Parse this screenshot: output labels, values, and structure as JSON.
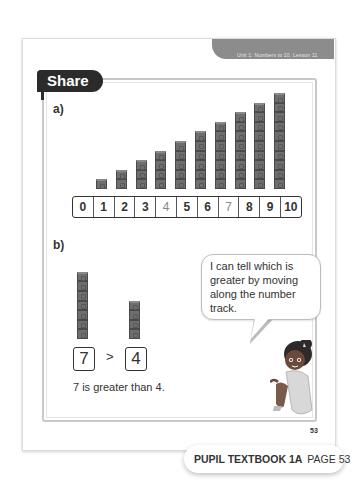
{
  "header": {
    "unit_label": "Unit 1: Numbers to 10, Lesson 11",
    "section_tab": "Share"
  },
  "part_a": {
    "label": "a)",
    "towers": [
      1,
      2,
      3,
      4,
      5,
      6,
      7,
      8,
      9,
      10
    ],
    "number_track": [
      "0",
      "1",
      "2",
      "3",
      "4",
      "5",
      "6",
      "7",
      "8",
      "9",
      "10"
    ],
    "light_cells": [
      4,
      7
    ]
  },
  "part_b": {
    "label": "b)",
    "left_tower": 7,
    "right_tower": 4,
    "left_number": "7",
    "comparison_symbol": ">",
    "right_number": "4",
    "caption": "7 is greater than 4."
  },
  "speech_bubble": {
    "text": "I can tell which is greater by moving along the number track."
  },
  "footer": {
    "page_number": "53",
    "book_label": "PUPIL TEXTBOOK 1A",
    "page_label": "PAGE 53"
  },
  "colors": {
    "cube": "#6e6e6e",
    "tab": "#2b2b2b",
    "banner": "#8c8c8c"
  }
}
